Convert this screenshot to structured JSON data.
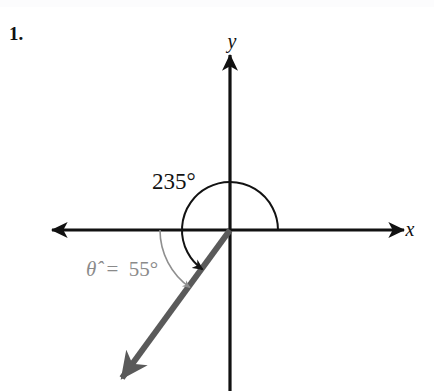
{
  "page": {
    "background_color": "#ffffff",
    "width": 434,
    "height": 391
  },
  "problem": {
    "number_label": "1."
  },
  "chart_data": {
    "type": "diagram",
    "subtype": "coordinate-plane-angle",
    "title": "",
    "axes": {
      "x_label": "x",
      "y_label": "y",
      "origin": {
        "x": 230,
        "y": 230
      },
      "x_axis": {
        "left_tip_x": 52,
        "right_tip_x": 404,
        "y": 230
      },
      "y_axis": {
        "top_tip_y": 55,
        "bottom_y": 391,
        "x": 230
      },
      "axis_color": "#111111",
      "axis_stroke_width": 3.2,
      "arrowheads": [
        "x-left",
        "x-right",
        "y-up"
      ]
    },
    "terminal_ray": {
      "label": "terminal side",
      "color": "#5a5a5a",
      "stroke_width": 6,
      "angle_degrees": 235,
      "start": {
        "x": 230,
        "y": 230
      },
      "end": {
        "x": 120,
        "y": 381
      },
      "has_arrowhead": true
    },
    "angles": [
      {
        "name": "standard-angle",
        "value": 235,
        "label": "235°",
        "unit": "degrees",
        "color": "#121212",
        "arc_radius": 48,
        "arc_start_degrees": 0,
        "arc_end_degrees": 235,
        "direction": "counterclockwise",
        "stroke_width": 2,
        "label_position": {
          "x": 152,
          "y": 189
        }
      },
      {
        "name": "reference-angle",
        "value": 55,
        "label": "θ̂ = 55°",
        "label_symbol": "θ̂",
        "label_equals": "=",
        "label_value": "55°",
        "unit": "degrees",
        "color": "#8f8f8f",
        "arc_radius": 70,
        "arc_start_degrees": 180,
        "arc_end_degrees": 235,
        "direction": "counterclockwise",
        "stroke_width": 1.6,
        "label_position": {
          "x": 86,
          "y": 276
        }
      }
    ],
    "quadrant_of_terminal_side": 3,
    "grid": false,
    "legend": false,
    "tick_labels": []
  }
}
